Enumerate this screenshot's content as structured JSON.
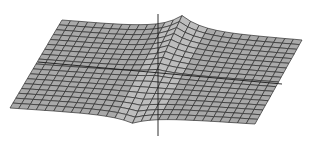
{
  "figure": {
    "type": "3d-wireframe-surface",
    "colors": {
      "background": "#ffffff",
      "surface_fill": "#a9a9a9",
      "surface_light": "#bdbdbd",
      "mesh_line": "#2e2e2e",
      "axis_line": "#1a1a1a"
    },
    "mesh": {
      "rows": 18,
      "cols": 28
    }
  }
}
